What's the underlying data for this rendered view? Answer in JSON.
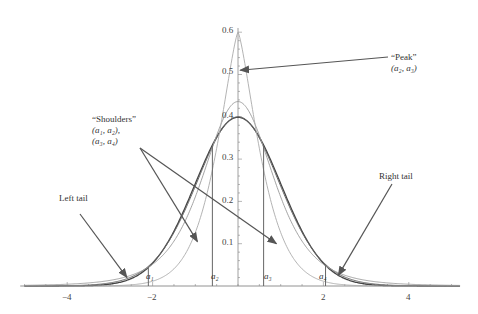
{
  "chart_data": {
    "type": "line",
    "title": "",
    "xlabel": "",
    "ylabel": "",
    "xlim": [
      -5,
      5
    ],
    "ylim": [
      0,
      0.6
    ],
    "grid": false,
    "x_ticks": [
      -4,
      -2,
      2,
      4
    ],
    "x_tick_labels": [
      "−4",
      "−2",
      "2",
      "4"
    ],
    "y_ticks": [
      0.1,
      0.2,
      0.3,
      0.4,
      0.5,
      0.6
    ],
    "y_tick_labels": [
      "0.1",
      "0.2",
      "0.3",
      "0.4",
      "0.5",
      "0.6"
    ],
    "series": [
      {
        "name": "density A (normal-like)",
        "peak": 0.399,
        "kind": "normal",
        "sigma": 1.0
      },
      {
        "name": "density B",
        "peak": 0.41,
        "kind": "t",
        "df": 20
      },
      {
        "name": "density C",
        "peak": 0.44,
        "kind": "t-scaled",
        "df": 6
      },
      {
        "name": "density D (sharp peak)",
        "peak": 0.6,
        "kind": "laplace-like"
      }
    ],
    "crossing_points": [
      {
        "label": "a1",
        "x": -2.1
      },
      {
        "label": "a2",
        "x": -0.6
      },
      {
        "label": "a3",
        "x": 0.6
      },
      {
        "label": "a4",
        "x": 2.05
      }
    ],
    "annotations": [
      {
        "text": "“Peak”",
        "subtext": "(a2, a3)",
        "arrow_to": {
          "x": 0.05,
          "y": 0.51
        }
      },
      {
        "text": "“Shoulders”",
        "subtext": "(a1, a2), (a3, a4)",
        "arrow_to": [
          {
            "x": -0.9,
            "y": 0.1
          },
          {
            "x": 1.15,
            "y": 0.1
          }
        ]
      },
      {
        "text": "Left tail",
        "arrow_to": {
          "x": -2.5,
          "y": 0.02
        }
      },
      {
        "text": "Right tail",
        "arrow_to": {
          "x": 2.4,
          "y": 0.02
        }
      }
    ]
  },
  "labels": {
    "peak_title": "“Peak”",
    "peak_sub": "(a₂, a₃)",
    "shoulders_title": "“Shoulders”",
    "shoulders_sub1": "(a₁, a₂),",
    "shoulders_sub2": "(a₃, a₄)",
    "left_tail": "Left tail",
    "right_tail": "Right tail",
    "a1": "a₁",
    "a2": "a₂",
    "a3": "a₃",
    "a4": "a₄"
  },
  "ticks": {
    "x": [
      "−4",
      "−2",
      "2",
      "4"
    ],
    "y": [
      "0.1",
      "0.2",
      "0.3",
      "0.4",
      "0.5",
      "0.6"
    ]
  }
}
